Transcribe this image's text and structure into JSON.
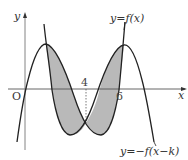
{
  "diagram": {
    "type": "function-graph",
    "axes": {
      "x_label": "x",
      "y_label": "y",
      "origin_label": "O",
      "x_ticks": [
        {
          "value": 4,
          "label": "4",
          "position": "above",
          "dotted_guide": true
        },
        {
          "value": 6,
          "label": "6",
          "position": "below"
        }
      ]
    },
    "curves": [
      {
        "id": "f",
        "label": "y=f(x)",
        "shape": "cubic rising-falling-rising"
      },
      {
        "id": "neg_f_shift",
        "label": "y=−f(x−k)",
        "shape": "cubic falling-rising-falling"
      }
    ],
    "shaded_region": {
      "description": "Two lobes enclosed between y=f(x) and y=−f(x−k), symmetric about x=4",
      "color": "#b9b9b9"
    },
    "colors": {
      "curve": "#222222",
      "axis": "#555555",
      "shade": "#b9b9b9"
    }
  }
}
